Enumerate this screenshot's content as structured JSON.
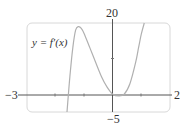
{
  "chart_data": {
    "type": "line",
    "title": "",
    "annotation": "y = f'(x)",
    "xlabel": "",
    "ylabel": "",
    "xlim": [
      -3,
      2
    ],
    "ylim": [
      -5,
      20
    ],
    "x_tick_labels": [
      "-3",
      "2"
    ],
    "y_tick_labels": [
      "-5",
      "20"
    ],
    "x_ticks": [
      -2,
      -1,
      1
    ],
    "y_ticks": [
      10
    ],
    "grid": false,
    "series": [
      {
        "name": "y = f'(x)",
        "color": "#b0b0b0",
        "x": [
          -1.6,
          -1.5,
          -1.4,
          -1.3,
          -1.2,
          -1.1,
          -1.0,
          -0.8,
          -0.6,
          -0.4,
          -0.2,
          0.0,
          0.2,
          0.4,
          0.6,
          0.8,
          0.9,
          1.0,
          1.1
        ],
        "y": [
          -5,
          5,
          13,
          18,
          19,
          18.5,
          17,
          13,
          9,
          5,
          2,
          0,
          -0.5,
          0,
          3,
          9,
          13,
          17,
          20
        ]
      }
    ]
  },
  "labels": {
    "function": "y = f′(x)",
    "x_min": "−3",
    "x_max": "2",
    "y_max": "20",
    "y_min": "−5"
  }
}
